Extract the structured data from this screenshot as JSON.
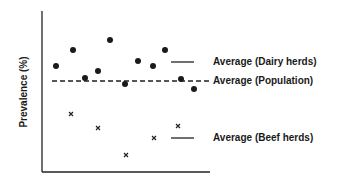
{
  "chart_data": {
    "type": "scatter",
    "title": "",
    "xlabel": "",
    "ylabel": "Prevalence (%)",
    "grid": false,
    "series": [
      {
        "name": "Dairy herds",
        "marker": "filled-circle",
        "points_px": [
          [
            56,
            66
          ],
          [
            73,
            50
          ],
          [
            85,
            78
          ],
          [
            98,
            71
          ],
          [
            110,
            40
          ],
          [
            125,
            84
          ],
          [
            138,
            61
          ],
          [
            153,
            66
          ],
          [
            165,
            50
          ],
          [
            181,
            79
          ],
          [
            194,
            89
          ]
        ]
      },
      {
        "name": "Beef herds",
        "marker": "x",
        "points_px": [
          [
            71,
            114
          ],
          [
            98,
            128
          ],
          [
            126,
            155
          ],
          [
            154,
            138
          ],
          [
            178,
            126
          ]
        ]
      }
    ],
    "reference_lines": [
      {
        "label": "Average (Dairy herds)",
        "style": "solid",
        "y_px": 62,
        "x_px": [
          171,
          194
        ]
      },
      {
        "label": "Average (Population)",
        "style": "dashed",
        "y_px": 81,
        "x_px": [
          52,
          210
        ]
      },
      {
        "label": "Average (Beef herds)",
        "style": "solid",
        "y_px": 138,
        "x_px": [
          171,
          194
        ]
      }
    ]
  },
  "axes": {
    "y_label": "Prevalence (%)"
  },
  "legend": {
    "dairy": "Average (Dairy herds)",
    "population": "Average (Population)",
    "beef": "Average (Beef herds)"
  }
}
